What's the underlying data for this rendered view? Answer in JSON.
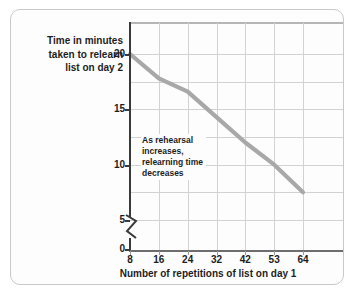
{
  "figure": {
    "background_color": "#fdfdfd",
    "border_color": "#c9c9c9"
  },
  "chart_data": {
    "type": "line",
    "title": "",
    "ylabel_lines": [
      "Time in minutes",
      "taken to relearn",
      "list on day 2"
    ],
    "ylabel": "Time in minutes taken to relearn list on day 2",
    "xlabel": "Number of repetitions of list on day 1",
    "categories": [
      "8",
      "16",
      "24",
      "32",
      "42",
      "53",
      "64"
    ],
    "x": [
      8,
      16,
      24,
      32,
      42,
      53,
      64
    ],
    "values": [
      20,
      17.8,
      16.6,
      14.3,
      12,
      10,
      7.5
    ],
    "series": [
      {
        "name": "Relearning time",
        "color": "#a8a8a8",
        "values": [
          20,
          17.8,
          16.6,
          14.3,
          12,
          10,
          7.5
        ]
      }
    ],
    "ylim": [
      0,
      22
    ],
    "yticks": [
      "0",
      "5",
      "10",
      "15",
      "20"
    ],
    "ytick_values": [
      0,
      5,
      10,
      15,
      20
    ],
    "xticks": [
      "8",
      "16",
      "24",
      "32",
      "42",
      "53",
      "64"
    ],
    "grid": true,
    "y_axis_break": true,
    "y_axis_break_between": [
      0,
      5
    ],
    "legend": "none",
    "annotations": [
      {
        "name": "trend-note",
        "lines": [
          "As rehearsal",
          "increases,",
          "relearning time",
          "decreases"
        ],
        "text": "As rehearsal increases, relearning time decreases"
      }
    ],
    "line_color": "#a8a8a8",
    "gridline_color": "#d2d2d2",
    "axis_color": "#3a3a3a"
  }
}
